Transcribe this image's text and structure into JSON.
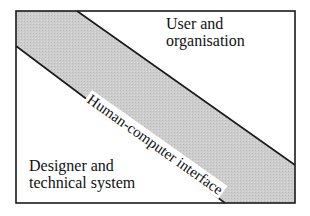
{
  "diagram": {
    "regions": {
      "top_right": {
        "line1": "User and",
        "line2": "organisation"
      },
      "bottom_left": {
        "line1": "Designer and",
        "line2": "technical system"
      },
      "band": {
        "label": "Human-computer interface"
      }
    },
    "colors": {
      "band_fill": "#c8c8c8",
      "frame": "#1a1a1a",
      "background": "#ffffff"
    }
  }
}
